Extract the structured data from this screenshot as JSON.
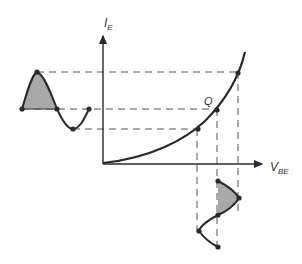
{
  "diagram": {
    "title": "",
    "axes": {
      "y_label": "I",
      "y_label_sub": "E",
      "x_label": "V",
      "x_label_sub": "BE"
    },
    "operating_point_label": "Q",
    "colors": {
      "line": "#2a2a2a",
      "dashed": "#555555",
      "fill": "#a8a8a8",
      "background": "#ffffff"
    },
    "curve": {
      "description": "Exponential I_E vs V_BE characteristic",
      "points": [
        [
          103,
          164
        ],
        [
          150,
          156
        ],
        [
          180,
          143
        ],
        [
          197,
          129
        ],
        [
          217,
          110
        ],
        [
          238,
          74
        ],
        [
          245,
          52
        ]
      ]
    },
    "input_waveform_vbe": {
      "description": "Input V_BE sinusoid drawn below x-axis",
      "points": [
        [
          218,
          181
        ],
        [
          239,
          198
        ],
        [
          218,
          215
        ],
        [
          199,
          231
        ],
        [
          218,
          247
        ]
      ]
    },
    "output_waveform_ie": {
      "description": "Output I_E waveform drawn left of y-axis (distorted)",
      "points": [
        [
          22,
          109
        ],
        [
          37,
          72
        ],
        [
          57,
          109
        ],
        [
          73,
          129
        ],
        [
          89,
          109
        ]
      ]
    }
  }
}
